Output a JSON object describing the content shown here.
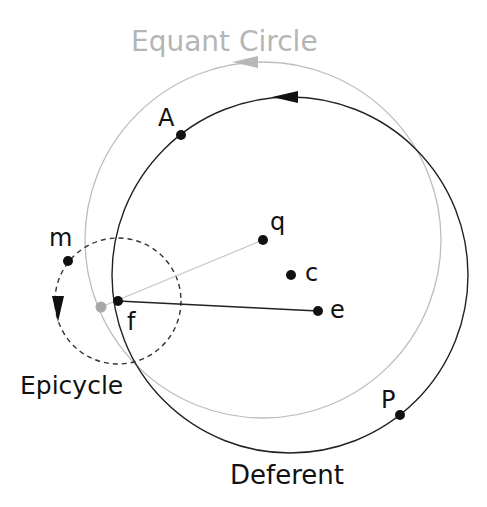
{
  "title": "Equant Circle",
  "labels": {
    "equant_circle": "Equant Circle",
    "deferent": "Deferent",
    "epicycle": "Epicycle",
    "A": "A",
    "P": "P",
    "m": "m",
    "q": "q",
    "c": "c",
    "e": "e",
    "f": "f"
  },
  "colors": {
    "ink": "#111111",
    "grey": "#b0b0b0",
    "grey_dot": "#a8a8a8"
  }
}
